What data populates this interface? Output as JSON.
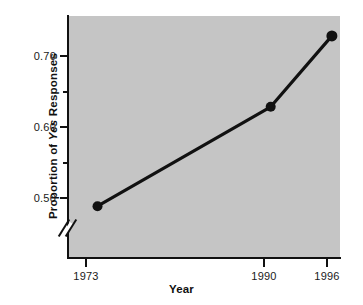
{
  "chart_data": {
    "type": "line",
    "title": "",
    "xlabel": "Year",
    "ylabel": "Proportion of Yes Responses",
    "ylabel_parts": {
      "before": "Proportion of ",
      "emphasis": "Yes",
      "after": " Responses"
    },
    "x": [
      1973,
      1990,
      1996
    ],
    "categories": [
      "1973",
      "1990",
      "1996"
    ],
    "values": [
      0.51,
      0.65,
      0.75
    ],
    "series": [
      {
        "name": "Proportion of Yes Responses",
        "values": [
          0.51,
          0.65,
          0.75
        ]
      }
    ],
    "xlim": [
      1970.1,
      1996.8
    ],
    "ylim": [
      0.437,
      0.778
    ],
    "y_axis_break": true,
    "y_break_note": "axis break (double slash) below 0.50",
    "yticks_major": [
      0.5,
      0.6,
      0.7
    ],
    "ytick_labels": [
      "0.50",
      "0.60",
      "0.70"
    ],
    "yticks_minor": [
      0.55,
      0.65,
      0.75
    ],
    "xticks": [
      1973,
      1990,
      1996
    ],
    "xtick_labels": [
      "1973",
      "1990",
      "1996"
    ],
    "grid": false,
    "legend": false,
    "legend_position": "none",
    "marker": "filled-circle",
    "plot_background": "#c5c5c5",
    "line_color": "#111111",
    "marker_color": "#111111",
    "figure_background": "#ffffff"
  },
  "axes": {
    "y_labels": [
      {
        "text": "0.70",
        "value": 0.7
      },
      {
        "text": "0.60",
        "value": 0.6
      },
      {
        "text": "0.50",
        "value": 0.5
      }
    ],
    "x_labels": [
      {
        "text": "1973",
        "value": 1973
      },
      {
        "text": "1990",
        "value": 1990
      },
      {
        "text": "1996",
        "value": 1996
      }
    ]
  }
}
